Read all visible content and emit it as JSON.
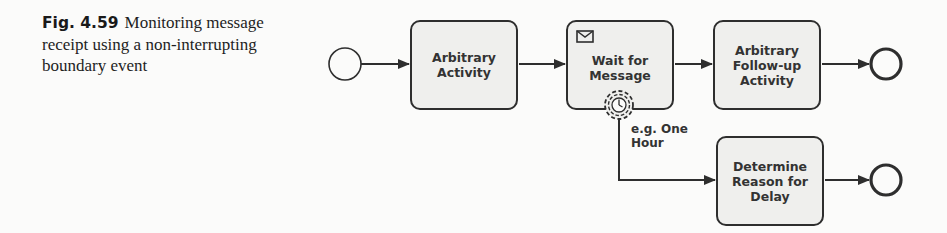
{
  "caption": {
    "figure_number": "Fig. 4.59",
    "text": "Monitoring message receipt using a non-interrupting boundary event"
  },
  "diagram": {
    "start_event": {
      "type": "start-event"
    },
    "tasks": [
      {
        "id": "t1",
        "label": "Arbitrary\nActivity"
      },
      {
        "id": "t2",
        "label": "Wait for\nMessage",
        "marker": "envelope-icon"
      },
      {
        "id": "t3",
        "label": "Arbitrary\nFollow-up\nActivity"
      },
      {
        "id": "t4",
        "label": "Determine\nReason for\nDelay"
      }
    ],
    "boundary_event": {
      "type": "non-interrupting-timer",
      "attached_to": "t2",
      "label": "e.g. One\nHour"
    },
    "end_events": [
      {
        "id": "e1",
        "type": "end-event"
      },
      {
        "id": "e2",
        "type": "end-event"
      }
    ],
    "colors": {
      "stroke": "#2e2e2e",
      "task_fill": "#efefed",
      "background": "#fbfbfa"
    }
  }
}
